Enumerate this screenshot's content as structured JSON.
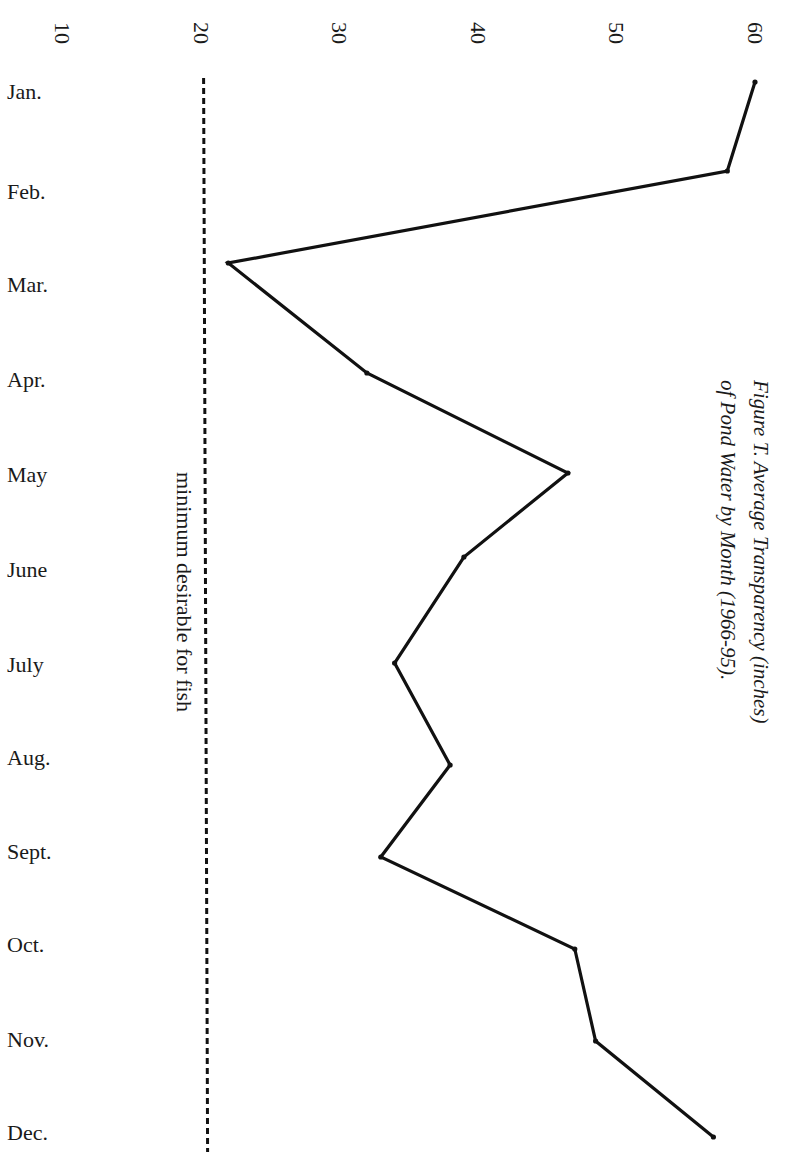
{
  "chart_data": {
    "type": "line",
    "orientation": "rotated-90-clockwise",
    "title": "Figure T. Average Transparency (inches) of Pond Water by Month (1966-95).",
    "title_lines": [
      "Figure T. Average Transparency (inches)",
      "of Pond Water by Month (1966-95)."
    ],
    "xlabel": "",
    "ylabel": "Average Transparency (inches)",
    "categories": [
      "Jan.",
      "Feb.",
      "Mar.",
      "Apr.",
      "May",
      "June",
      "July",
      "Aug.",
      "Sept.",
      "Oct.",
      "Nov.",
      "Dec."
    ],
    "series": [
      {
        "name": "Average Transparency",
        "values": [
          60,
          58,
          22,
          32,
          46.5,
          39,
          34,
          38,
          33,
          47,
          48.5,
          57
        ],
        "color": "#111111"
      }
    ],
    "value_axis": {
      "ticks": [
        10,
        20,
        30,
        40,
        50,
        60
      ],
      "tick_labels": [
        "10",
        "20",
        "30",
        "40",
        "50",
        "60"
      ],
      "range": [
        10,
        60
      ]
    },
    "reference_line": {
      "value": 20,
      "style": "dashed",
      "label": "minimum desirable for fish"
    },
    "grid": false,
    "legend": "none"
  },
  "layout": {
    "value_axis_origin_px": 62,
    "px_per_unit": 13.86,
    "point_y_px": [
      82,
      171,
      263,
      373,
      473,
      557,
      663,
      765,
      857,
      949,
      1041,
      1137
    ],
    "label_y_px": [
      92,
      192,
      285,
      380,
      475,
      570,
      665,
      758,
      852,
      945,
      1040,
      1133
    ],
    "reference_line_y": [
      78,
      1152
    ]
  }
}
